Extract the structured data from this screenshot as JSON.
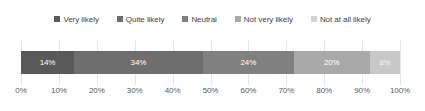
{
  "chart_data": {
    "type": "bar",
    "orientation": "horizontal",
    "stacked": true,
    "normalized_percent": true,
    "title": "",
    "subtitle": "",
    "xlabel": "",
    "ylabel": "",
    "categories": [
      ""
    ],
    "xlim": [
      0,
      100
    ],
    "grid": true,
    "legend_position": "top",
    "xticks": [
      "0%",
      "10%",
      "20%",
      "30%",
      "40%",
      "50%",
      "60%",
      "70%",
      "80%",
      "90%",
      "100%"
    ],
    "xtick_values": [
      0,
      10,
      20,
      30,
      40,
      50,
      60,
      70,
      80,
      90,
      100
    ],
    "series": [
      {
        "name": "Very likely",
        "values": [
          14
        ],
        "label": "14%",
        "color": "#595959"
      },
      {
        "name": "Quite likely",
        "values": [
          34
        ],
        "label": "34%",
        "color": "#6e6e6e"
      },
      {
        "name": "Neutral",
        "values": [
          24
        ],
        "label": "24%",
        "color": "#808080"
      },
      {
        "name": "Not very likely",
        "values": [
          20
        ],
        "label": "20%",
        "color": "#a9a9a9"
      },
      {
        "name": "Not at all likely",
        "values": [
          8
        ],
        "label": "8%",
        "color": "#c8c8c8"
      }
    ]
  },
  "legend": {
    "items": [
      {
        "label": "Very likely",
        "color": "#595959"
      },
      {
        "label": "Quite likely",
        "color": "#6e6e6e"
      },
      {
        "label": "Neutral",
        "color": "#808080"
      },
      {
        "label": "Not very likely",
        "color": "#a9a9a9"
      },
      {
        "label": "Not at all likely",
        "color": "#d3d3d3"
      }
    ]
  },
  "colors": {
    "background": "#ffffff",
    "gridline": "#e6e6e6",
    "axis_text": "#5a5a5a",
    "legend_text": "#3f3f3f",
    "segment_text": "#ffffff"
  }
}
